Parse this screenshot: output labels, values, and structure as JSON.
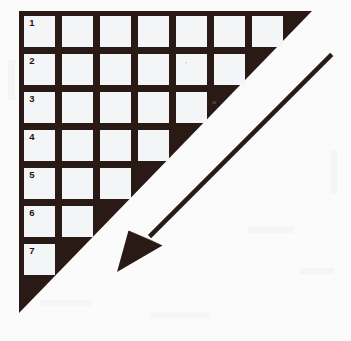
{
  "figure": {
    "background_color": "#fbfbfc",
    "ink_color": "#2a1a16",
    "cell_color": "#f4f5f7"
  },
  "triangle": {
    "name": "right-triangle-shape",
    "right_angle_corner": "top-left",
    "vertices": [
      {
        "x": 19,
        "y": 11
      },
      {
        "x": 312,
        "y": 11
      },
      {
        "x": 19,
        "y": 313
      }
    ]
  },
  "grid": {
    "rows_total": 7,
    "cell_width": 31,
    "cell_height": 31,
    "pitch_x": 38,
    "pitch_y": 38,
    "origin_x": 24,
    "origin_y": 16,
    "rows": [
      {
        "label": "1",
        "cells": 7
      },
      {
        "label": "2",
        "cells": 6
      },
      {
        "label": "3",
        "cells": 5
      },
      {
        "label": "4",
        "cells": 4
      },
      {
        "label": "5",
        "cells": 3
      },
      {
        "label": "6",
        "cells": 2
      },
      {
        "label": "7",
        "cells": 1
      }
    ]
  },
  "arrow": {
    "name": "direction-arrow",
    "direction": "down-left",
    "tail": {
      "x": 327,
      "y": 56
    },
    "tip": {
      "x": 117,
      "y": 272
    },
    "shaft_width": 9,
    "head_length": 40,
    "head_width": 36,
    "color": "#2a1a16"
  },
  "annotations": [
    {
      "label": "o",
      "x": 214,
      "y": 102
    },
    {
      "label": "'",
      "x": 186,
      "y": 64
    }
  ]
}
